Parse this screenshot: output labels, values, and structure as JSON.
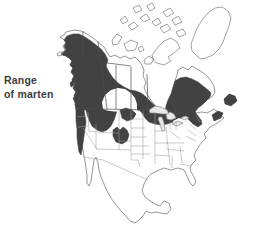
{
  "caption": {
    "line1": "Range",
    "line2": "of marten"
  },
  "colors": {
    "background": "#ffffff",
    "range_fill": "#424242",
    "coast_outline": "#8a8a8a",
    "lake_outline": "#8a8a8a",
    "state_border": "#9e9e9e",
    "province_border": "#4d4d4d",
    "caption_text": "#3d3d3d"
  }
}
